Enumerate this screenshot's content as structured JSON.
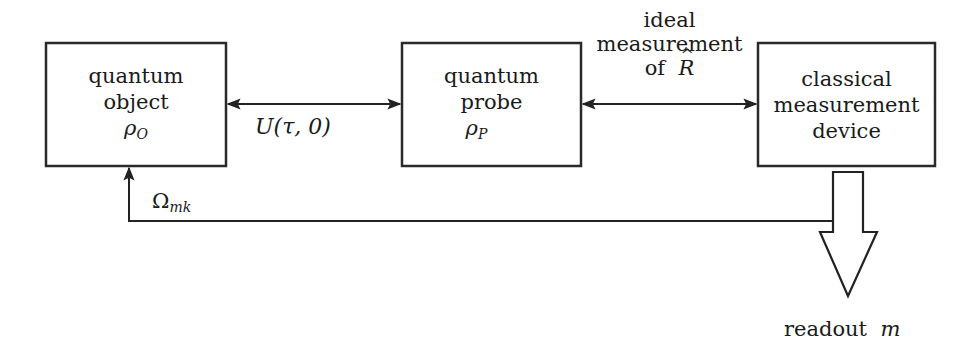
{
  "diagram": {
    "nodes": [
      {
        "id": "quantum-object",
        "lines": [
          "quantum",
          "object"
        ],
        "symbol": "ρ",
        "symbol_sub": "O"
      },
      {
        "id": "quantum-probe",
        "lines": [
          "quantum",
          "probe"
        ],
        "symbol": "ρ",
        "symbol_sub": "P"
      },
      {
        "id": "classical-device",
        "lines": [
          "classical",
          "measurement",
          "device"
        ]
      }
    ],
    "edges": [
      {
        "from": "quantum-object",
        "to": "quantum-probe",
        "type": "bidirectional",
        "label_main": "U",
        "label_args": "(τ, 0)"
      },
      {
        "from": "quantum-probe",
        "to": "classical-device",
        "type": "bidirectional",
        "label_lines": [
          "ideal",
          "measurement"
        ],
        "label_of": "of",
        "label_symbol": "R"
      },
      {
        "from": "classical-device",
        "to": "quantum-object",
        "type": "feedback",
        "label_symbol": "Ω",
        "label_sub": "mk"
      },
      {
        "from": "classical-device",
        "to": "output",
        "type": "hollow-arrow",
        "label_text": "readout",
        "label_symbol": "m"
      }
    ]
  }
}
